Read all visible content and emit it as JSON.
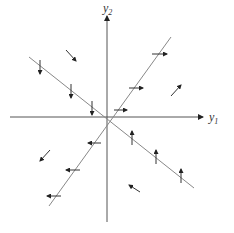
{
  "diagram": {
    "type": "phase-portrait",
    "axes": {
      "horizontal": {
        "label": "y",
        "subscript": "1"
      },
      "vertical": {
        "label": "y",
        "subscript": "2"
      }
    },
    "eigenlines": [
      {
        "name": "line-a",
        "direction": "down-right",
        "arrow_direction_on_line": "vertical",
        "description": "arrows point away from line toward y1 axis side: down on left half, up on right half"
      },
      {
        "name": "line-b",
        "direction": "up-right",
        "arrow_direction_on_line": "horizontal",
        "description": "arrows point right on upper half, left on lower half"
      }
    ],
    "free_arrows": [
      {
        "quadrant": "upper-left",
        "direction": "down-right"
      },
      {
        "quadrant": "upper-right",
        "direction": "up-right"
      },
      {
        "quadrant": "lower-left",
        "direction": "down-left"
      },
      {
        "quadrant": "lower-right",
        "direction": "up-left"
      }
    ],
    "colors": {
      "axis": "#555555",
      "line": "#888888",
      "arrow": "#333333"
    }
  }
}
